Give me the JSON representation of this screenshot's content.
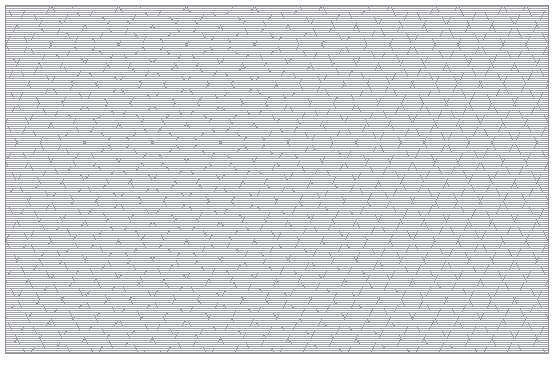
{
  "page": {
    "width": 560,
    "height": 365,
    "background_color": "#ffffff"
  },
  "sheet": {
    "name": "isometric-dot-grid-sheet",
    "left": 5,
    "top": 5,
    "width": 544,
    "height": 349,
    "background_color": "#ffffff",
    "border_color": "#8f8f96",
    "border_width": 1
  },
  "grid": {
    "type": "isometric-triangular-dot-grid",
    "dot_color": "#a3a3ab",
    "dot_size": 1,
    "dot_pitch": 2,
    "column_width": 34,
    "row_height": 20,
    "vertical_period": 40,
    "diagonal_pitch": 19.6,
    "line_families": [
      {
        "name": "vertical",
        "angle_deg": 0
      },
      {
        "name": "diagonal-right",
        "angle_deg": 60
      },
      {
        "name": "diagonal-left",
        "angle_deg": -60
      }
    ]
  }
}
